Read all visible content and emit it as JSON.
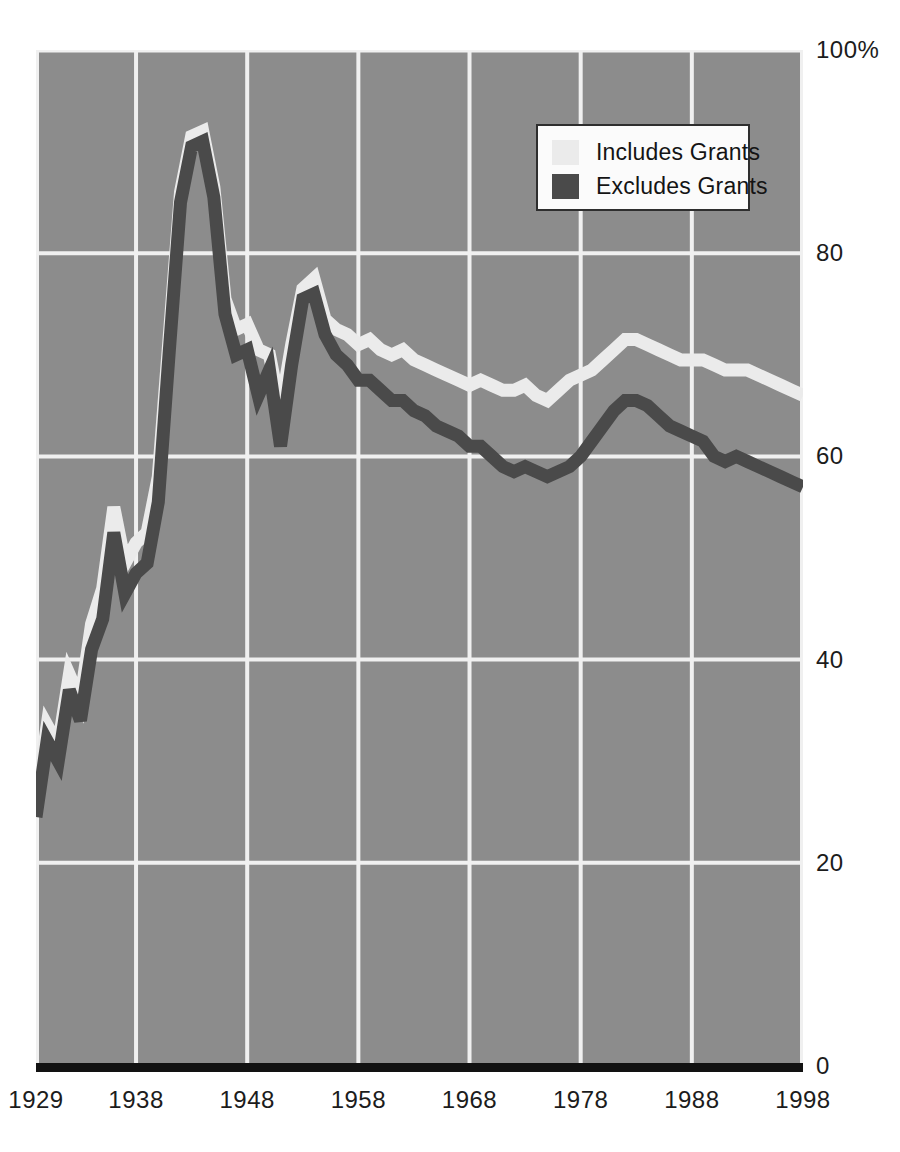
{
  "figure": {
    "clipped_title_fragment": "",
    "background_color": "#ffffff",
    "plot_background_color": "#8c8c8c",
    "gridline_color": "#f0f0f0",
    "axis_color": "#121212"
  },
  "legend": {
    "position": "inside-top-right",
    "entries": [
      {
        "label": "Includes Grants",
        "color": "#ebebeb",
        "swatch_name": "legend-swatch-includes-grants"
      },
      {
        "label": "Excludes Grants",
        "color": "#4a4a4a",
        "swatch_name": "legend-swatch-excludes-grants"
      }
    ]
  },
  "chart_data": {
    "type": "line",
    "title": "",
    "subtitle": "",
    "xlabel": "",
    "ylabel": "",
    "xlim": [
      1929,
      1998
    ],
    "ylim": [
      0,
      100
    ],
    "y_tick_labels": [
      "100%",
      "80",
      "60",
      "40",
      "20",
      "0"
    ],
    "y_ticks": [
      100,
      80,
      60,
      40,
      20,
      0
    ],
    "x_tick_labels": [
      "1929",
      "1938",
      "1948",
      "1958",
      "1968",
      "1978",
      "1988",
      "1998"
    ],
    "x_ticks": [
      1929,
      1938,
      1948,
      1958,
      1968,
      1978,
      1988,
      1998
    ],
    "grid": true,
    "grid_axis": "both",
    "legend_position": "upper right",
    "x": [
      1929,
      1930,
      1931,
      1932,
      1933,
      1934,
      1935,
      1936,
      1937,
      1938,
      1939,
      1940,
      1941,
      1942,
      1943,
      1944,
      1945,
      1946,
      1947,
      1948,
      1949,
      1950,
      1951,
      1952,
      1953,
      1954,
      1955,
      1956,
      1957,
      1958,
      1959,
      1960,
      1961,
      1962,
      1963,
      1964,
      1965,
      1966,
      1967,
      1968,
      1969,
      1970,
      1971,
      1972,
      1973,
      1974,
      1975,
      1976,
      1977,
      1978,
      1979,
      1980,
      1981,
      1982,
      1983,
      1984,
      1985,
      1986,
      1987,
      1988,
      1989,
      1990,
      1991,
      1992,
      1993,
      1994,
      1995,
      1996,
      1997,
      1998
    ],
    "series": [
      {
        "name": "Includes Grants",
        "color": "#ebebeb",
        "values": [
          26.0,
          33.5,
          31.5,
          38.5,
          36.0,
          43.5,
          47.0,
          55.0,
          49.5,
          51.5,
          52.5,
          58.0,
          72.0,
          86.0,
          91.5,
          92.0,
          86.5,
          75.5,
          72.5,
          73.0,
          70.5,
          70.0,
          64.5,
          71.0,
          76.5,
          77.5,
          73.5,
          72.5,
          72.0,
          71.0,
          71.5,
          70.5,
          70.0,
          70.5,
          69.5,
          69.0,
          68.5,
          68.0,
          67.5,
          67.0,
          67.5,
          67.0,
          66.5,
          66.5,
          67.0,
          66.0,
          65.5,
          66.5,
          67.5,
          68.0,
          68.5,
          69.5,
          70.5,
          71.5,
          71.5,
          71.0,
          70.5,
          70.0,
          69.5,
          69.5,
          69.5,
          69.0,
          68.5,
          68.5,
          68.5,
          68.0,
          67.5,
          67.0,
          66.5,
          66.0
        ]
      },
      {
        "name": "Excludes Grants",
        "color": "#4a4a4a",
        "values": [
          24.5,
          32.0,
          30.0,
          37.0,
          34.0,
          41.0,
          44.0,
          52.5,
          46.5,
          48.5,
          49.5,
          55.5,
          70.5,
          85.0,
          90.5,
          91.0,
          85.5,
          74.0,
          70.0,
          70.5,
          66.0,
          68.5,
          61.0,
          69.0,
          75.5,
          76.0,
          72.0,
          70.0,
          69.0,
          67.5,
          67.5,
          66.5,
          65.5,
          65.5,
          64.5,
          64.0,
          63.0,
          62.5,
          62.0,
          61.0,
          61.0,
          60.0,
          59.0,
          58.5,
          59.0,
          58.5,
          58.0,
          58.5,
          59.0,
          60.0,
          61.5,
          63.0,
          64.5,
          65.5,
          65.5,
          65.0,
          64.0,
          63.0,
          62.5,
          62.0,
          61.5,
          60.0,
          59.5,
          60.0,
          59.5,
          59.0,
          58.5,
          58.0,
          57.5,
          57.0
        ]
      }
    ]
  }
}
